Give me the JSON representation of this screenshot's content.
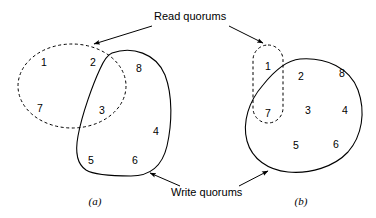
{
  "figure": {
    "width": 376,
    "height": 218,
    "background": "#ffffff",
    "stroke_color": "#000000"
  },
  "annotations": {
    "read_quorums_label": "Read quorums",
    "write_quorums_label": "Write quorums"
  },
  "panels": [
    {
      "id": "a",
      "caption": "(a)",
      "caption_pos": {
        "x": 95,
        "y": 201
      },
      "read_quorum": {
        "shape": "ellipse",
        "style": "dashed",
        "members": [
          {
            "label": "1",
            "x": 44,
            "y": 62
          },
          {
            "label": "2",
            "x": 93,
            "y": 62
          },
          {
            "label": "7",
            "x": 40,
            "y": 108
          },
          {
            "label": "3",
            "x": 102,
            "y": 110
          }
        ]
      },
      "write_quorum": {
        "shape": "blob",
        "style": "solid",
        "members": [
          {
            "label": "2",
            "x": 93,
            "y": 62
          },
          {
            "label": "8",
            "x": 139,
            "y": 68
          },
          {
            "label": "3",
            "x": 102,
            "y": 110
          },
          {
            "label": "4",
            "x": 156,
            "y": 131
          },
          {
            "label": "5",
            "x": 91,
            "y": 160
          },
          {
            "label": "6",
            "x": 135,
            "y": 160
          }
        ]
      },
      "all_members": [
        {
          "label": "1",
          "x": 44,
          "y": 62
        },
        {
          "label": "2",
          "x": 93,
          "y": 62
        },
        {
          "label": "8",
          "x": 139,
          "y": 68
        },
        {
          "label": "7",
          "x": 40,
          "y": 108
        },
        {
          "label": "3",
          "x": 102,
          "y": 110
        },
        {
          "label": "4",
          "x": 156,
          "y": 131
        },
        {
          "label": "5",
          "x": 91,
          "y": 160
        },
        {
          "label": "6",
          "x": 135,
          "y": 160
        }
      ]
    },
    {
      "id": "b",
      "caption": "(b)",
      "caption_pos": {
        "x": 301,
        "y": 201
      },
      "read_quorum": {
        "shape": "rounded-rect",
        "style": "dashed",
        "members": [
          {
            "label": "1",
            "x": 268,
            "y": 66
          },
          {
            "label": "7",
            "x": 268,
            "y": 113
          }
        ]
      },
      "write_quorum": {
        "shape": "blob",
        "style": "solid",
        "members": [
          {
            "label": "2",
            "x": 301,
            "y": 76
          },
          {
            "label": "8",
            "x": 342,
            "y": 73
          },
          {
            "label": "3",
            "x": 308,
            "y": 110
          },
          {
            "label": "4",
            "x": 345,
            "y": 110
          },
          {
            "label": "7",
            "x": 268,
            "y": 113
          },
          {
            "label": "5",
            "x": 296,
            "y": 145
          },
          {
            "label": "6",
            "x": 336,
            "y": 144
          }
        ]
      },
      "all_members": [
        {
          "label": "1",
          "x": 268,
          "y": 66
        },
        {
          "label": "2",
          "x": 301,
          "y": 76
        },
        {
          "label": "8",
          "x": 342,
          "y": 73
        },
        {
          "label": "7",
          "x": 268,
          "y": 113
        },
        {
          "label": "3",
          "x": 308,
          "y": 110
        },
        {
          "label": "4",
          "x": 345,
          "y": 110
        },
        {
          "label": "5",
          "x": 296,
          "y": 145
        },
        {
          "label": "6",
          "x": 336,
          "y": 144
        }
      ]
    }
  ]
}
